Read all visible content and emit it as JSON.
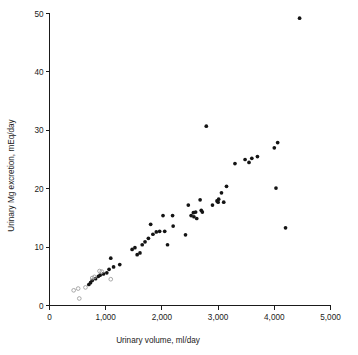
{
  "chart_data": {
    "type": "scatter",
    "title": "",
    "xlabel": "Urinary volume, ml/day",
    "ylabel": "Urinary Mg excretion, mEq/day",
    "xlim": [
      0,
      5000
    ],
    "ylim": [
      0,
      50
    ],
    "xticks": [
      0,
      1000,
      2000,
      3000,
      4000,
      5000
    ],
    "xticklabels": [
      "0",
      "1,000",
      "2,000",
      "3,000",
      "4,000",
      "5,000"
    ],
    "yticks": [
      0,
      10,
      20,
      30,
      40,
      50
    ],
    "yticklabels": [
      "0",
      "10",
      "20",
      "30",
      "40",
      "50"
    ],
    "grid": false,
    "legend": "none",
    "series": [
      {
        "name": "filled",
        "marker": "filled-circle",
        "color": "#141414",
        "points": [
          [
            700,
            3.6
          ],
          [
            730,
            3.9
          ],
          [
            760,
            4.3
          ],
          [
            820,
            4.6
          ],
          [
            870,
            5.0
          ],
          [
            900,
            5.2
          ],
          [
            960,
            5.4
          ],
          [
            1020,
            5.6
          ],
          [
            1060,
            6.2
          ],
          [
            1090,
            8.1
          ],
          [
            1140,
            6.6
          ],
          [
            1250,
            7.0
          ],
          [
            1470,
            9.6
          ],
          [
            1520,
            9.9
          ],
          [
            1560,
            8.7
          ],
          [
            1610,
            9.0
          ],
          [
            1650,
            10.4
          ],
          [
            1700,
            10.9
          ],
          [
            1760,
            11.5
          ],
          [
            1800,
            13.9
          ],
          [
            1840,
            12.2
          ],
          [
            1900,
            12.6
          ],
          [
            1960,
            12.7
          ],
          [
            2020,
            15.4
          ],
          [
            2050,
            12.7
          ],
          [
            2100,
            10.4
          ],
          [
            2190,
            15.4
          ],
          [
            2200,
            13.6
          ],
          [
            2420,
            12.1
          ],
          [
            2470,
            17.2
          ],
          [
            2520,
            15.4
          ],
          [
            2560,
            15.9
          ],
          [
            2570,
            15.2
          ],
          [
            2600,
            16.0
          ],
          [
            2620,
            14.9
          ],
          [
            2680,
            18.1
          ],
          [
            2700,
            16.3
          ],
          [
            2720,
            16.0
          ],
          [
            2790,
            30.7
          ],
          [
            2900,
            17.2
          ],
          [
            2980,
            17.9
          ],
          [
            3000,
            17.7
          ],
          [
            3010,
            18.2
          ],
          [
            3060,
            19.3
          ],
          [
            3100,
            17.7
          ],
          [
            3150,
            20.4
          ],
          [
            3300,
            24.3
          ],
          [
            3480,
            25.0
          ],
          [
            3550,
            24.5
          ],
          [
            3600,
            25.2
          ],
          [
            3700,
            25.5
          ],
          [
            4000,
            27.0
          ],
          [
            4030,
            20.1
          ],
          [
            4060,
            27.9
          ],
          [
            4200,
            13.3
          ],
          [
            4450,
            49.2
          ]
        ]
      },
      {
        "name": "open",
        "marker": "open-circle",
        "color": "#9a9a9a",
        "points": [
          [
            430,
            2.6
          ],
          [
            510,
            2.9
          ],
          [
            530,
            1.2
          ],
          [
            640,
            3.1
          ],
          [
            760,
            4.7
          ],
          [
            800,
            4.9
          ],
          [
            890,
            5.9
          ],
          [
            930,
            5.8
          ],
          [
            1090,
            4.5
          ]
        ]
      }
    ]
  },
  "axes": {
    "x_axis_name": "x-axis",
    "y_axis_name": "y-axis"
  }
}
